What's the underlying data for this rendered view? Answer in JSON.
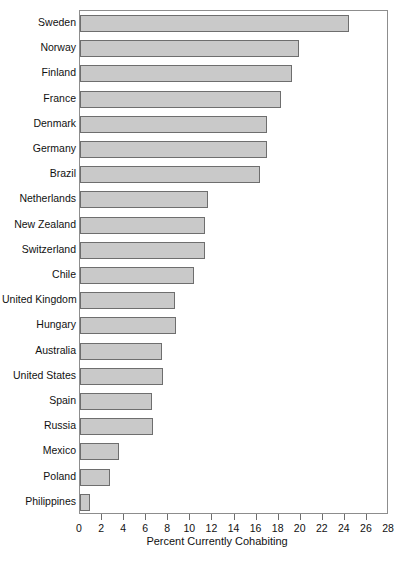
{
  "chart_data": {
    "type": "bar",
    "orientation": "horizontal",
    "title": "",
    "xlabel": "Percent Currently Cohabiting",
    "ylabel": "",
    "xlim": [
      0,
      28
    ],
    "xticks": [
      0,
      2,
      4,
      6,
      8,
      10,
      12,
      14,
      16,
      18,
      20,
      22,
      24,
      26,
      28
    ],
    "grid": false,
    "legend": null,
    "bar_color": "#c9c9c9",
    "bar_edge_color": "#6e6e6e",
    "categories": [
      "Sweden",
      "Norway",
      "Finland",
      "France",
      "Denmark",
      "Germany",
      "Brazil",
      "Netherlands",
      "New Zealand",
      "Switzerland",
      "Chile",
      "United Kingdom",
      "Hungary",
      "Australia",
      "United States",
      "Spain",
      "Russia",
      "Mexico",
      "Poland",
      "Philippines"
    ],
    "values": [
      24.4,
      19.8,
      19.2,
      18.2,
      16.9,
      16.9,
      16.3,
      11.6,
      11.3,
      11.3,
      10.3,
      8.6,
      8.7,
      7.4,
      7.5,
      6.5,
      6.6,
      3.5,
      2.7,
      0.9
    ]
  }
}
